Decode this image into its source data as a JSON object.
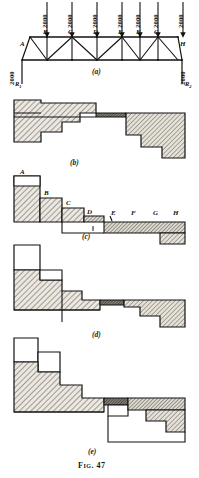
{
  "figure": {
    "caption": "Fig. 47",
    "panels": [
      {
        "id": "a",
        "label": "(a)",
        "kind": "truss-loading-diagram"
      },
      {
        "id": "b",
        "label": "(b)",
        "kind": "stepped-stress-diagram"
      },
      {
        "id": "c",
        "label": "(c)",
        "kind": "stepped-stress-diagram"
      },
      {
        "id": "d",
        "label": "(d)",
        "kind": "stepped-stress-diagram"
      },
      {
        "id": "e",
        "label": "(e)",
        "kind": "stepped-stress-diagram"
      }
    ]
  },
  "truss": {
    "nodes": [
      {
        "label": "A",
        "x": 22,
        "y": 44
      },
      {
        "label": "B",
        "x": 47,
        "y": 34
      },
      {
        "label": "C",
        "x": 72,
        "y": 34
      },
      {
        "label": "D",
        "x": 97,
        "y": 34
      },
      {
        "label": "E",
        "x": 122,
        "y": 34
      },
      {
        "label": "F",
        "x": 140,
        "y": 34
      },
      {
        "label": "G",
        "x": 158,
        "y": 34
      },
      {
        "label": "H",
        "x": 182,
        "y": 44
      }
    ],
    "loads": [
      {
        "value": "2000",
        "at": "B"
      },
      {
        "value": "2000",
        "at": "C"
      },
      {
        "value": "2000",
        "at": "D"
      },
      {
        "value": "2000",
        "at": "E"
      },
      {
        "value": "2000",
        "at": "F"
      },
      {
        "value": "2000",
        "at": "G"
      },
      {
        "value": "2000",
        "at": "H"
      }
    ],
    "reactions": [
      {
        "force": "2000",
        "name": "R",
        "sub": "1",
        "side": "left"
      },
      {
        "force": "2000",
        "name": "R",
        "sub": "2",
        "side": "right"
      }
    ]
  },
  "panel_c_labels": [
    {
      "text": "A",
      "x": 20,
      "y": 174
    },
    {
      "text": "B",
      "x": 44,
      "y": 195
    },
    {
      "text": "C",
      "x": 66,
      "y": 213
    },
    {
      "text": "D",
      "x": 89,
      "y": 222
    },
    {
      "text": "E",
      "x": 110,
      "y": 223
    },
    {
      "text": "F",
      "x": 132,
      "y": 222
    },
    {
      "text": "G",
      "x": 154,
      "y": 222
    },
    {
      "text": "H",
      "x": 174,
      "y": 222
    }
  ],
  "colors": {
    "ink": "#111111",
    "hatch": "#3a3a3a",
    "fill_light": "#e8e4dc",
    "fill_mid": "#d8d2c6",
    "paper": "#ffffff"
  }
}
